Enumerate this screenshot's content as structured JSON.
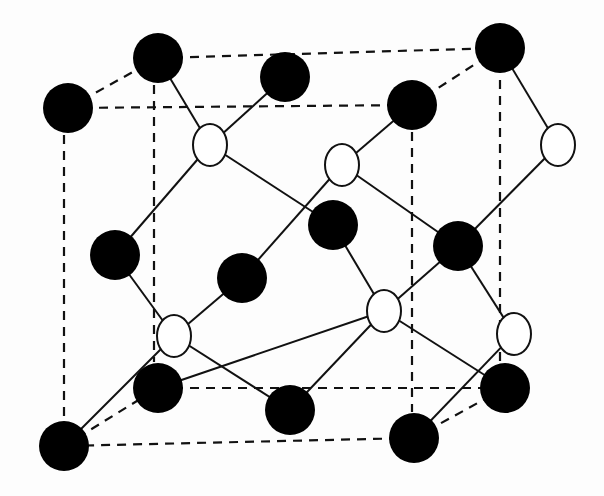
{
  "diagram": {
    "title": "Zinc blende crystal structure (unit cell)",
    "colors": {
      "background": "#fdfdfd",
      "stroke": "#111111",
      "atom_a_fill": "#000000",
      "atom_b_fill": "#ffffff"
    },
    "cell_edges_dashed": [
      [
        68,
        108,
        158,
        58
      ],
      [
        158,
        58,
        500,
        48
      ],
      [
        500,
        48,
        412,
        105
      ],
      [
        412,
        105,
        68,
        108
      ],
      [
        64,
        446,
        158,
        388
      ],
      [
        158,
        388,
        505,
        388
      ],
      [
        505,
        388,
        414,
        438
      ],
      [
        414,
        438,
        64,
        446
      ],
      [
        64,
        135,
        64,
        420
      ],
      [
        154,
        85,
        154,
        362
      ],
      [
        412,
        132,
        412,
        412
      ],
      [
        500,
        80,
        500,
        362
      ]
    ],
    "bonds": [
      [
        158,
        58,
        210,
        145
      ],
      [
        285,
        77,
        210,
        145
      ],
      [
        210,
        145,
        115,
        255
      ],
      [
        210,
        145,
        333,
        225
      ],
      [
        412,
        105,
        342,
        165
      ],
      [
        342,
        165,
        242,
        278
      ],
      [
        342,
        165,
        458,
        246
      ],
      [
        500,
        48,
        558,
        145
      ],
      [
        558,
        145,
        458,
        246
      ],
      [
        115,
        255,
        174,
        336
      ],
      [
        242,
        278,
        174,
        336
      ],
      [
        174,
        336,
        64,
        446
      ],
      [
        174,
        336,
        290,
        410
      ],
      [
        333,
        225,
        384,
        311
      ],
      [
        458,
        246,
        384,
        311
      ],
      [
        384,
        311,
        158,
        388
      ],
      [
        384,
        311,
        505,
        388
      ],
      [
        458,
        246,
        514,
        334
      ],
      [
        514,
        334,
        414,
        438
      ],
      [
        290,
        410,
        384,
        311
      ]
    ],
    "atoms_a": [
      {
        "x": 68,
        "y": 108
      },
      {
        "x": 158,
        "y": 58
      },
      {
        "x": 285,
        "y": 77
      },
      {
        "x": 412,
        "y": 105
      },
      {
        "x": 500,
        "y": 48
      },
      {
        "x": 115,
        "y": 255
      },
      {
        "x": 333,
        "y": 225
      },
      {
        "x": 242,
        "y": 278
      },
      {
        "x": 458,
        "y": 246
      },
      {
        "x": 158,
        "y": 388
      },
      {
        "x": 505,
        "y": 388
      },
      {
        "x": 64,
        "y": 446
      },
      {
        "x": 290,
        "y": 410
      },
      {
        "x": 414,
        "y": 438
      }
    ],
    "atoms_b": [
      {
        "x": 210,
        "y": 145
      },
      {
        "x": 342,
        "y": 165
      },
      {
        "x": 558,
        "y": 145
      },
      {
        "x": 174,
        "y": 336
      },
      {
        "x": 384,
        "y": 311
      },
      {
        "x": 514,
        "y": 334
      }
    ],
    "atom_a_radius": 25,
    "atom_b_rx": 17,
    "atom_b_ry": 21
  }
}
